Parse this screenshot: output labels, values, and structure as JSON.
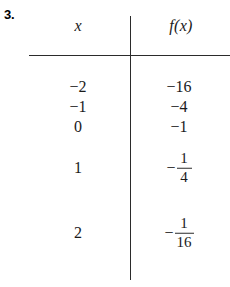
{
  "exercise": {
    "number_label": "3."
  },
  "table": {
    "headers": {
      "x": "x",
      "fx": "f(x)"
    },
    "rows": [
      {
        "x": "−2",
        "fx_type": "plain",
        "fx": "−16",
        "y": 87
      },
      {
        "x": "−1",
        "fx_type": "plain",
        "fx": "−4",
        "y": 107
      },
      {
        "x": "0",
        "fx_type": "plain",
        "fx": "−1",
        "y": 127
      },
      {
        "x": "1",
        "fx_type": "fraction",
        "fx": "−1/4",
        "sign": "−",
        "numerator": "1",
        "denominator": "4",
        "y": 168
      },
      {
        "x": "2",
        "fx_type": "fraction",
        "fx": "−1/16",
        "sign": "−",
        "numerator": "1",
        "denominator": "16",
        "y": 233
      }
    ]
  },
  "style": {
    "ink_color": "#2b2b2b",
    "page_color": "#ffffff"
  }
}
